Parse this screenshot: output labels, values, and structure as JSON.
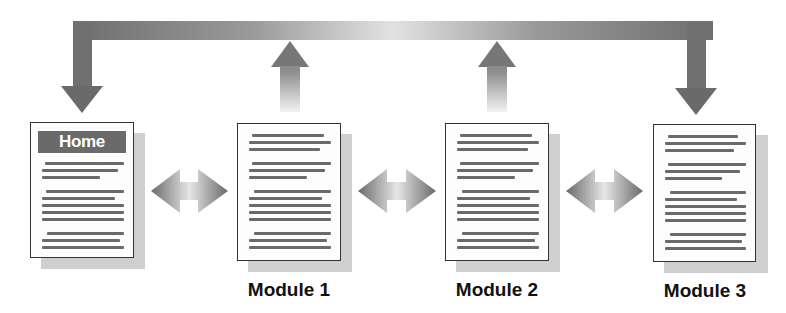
{
  "diagram": {
    "type": "module-navigation-flow",
    "home": {
      "banner": "Home Page"
    },
    "modules": [
      {
        "label": "Module 1"
      },
      {
        "label": "Module 2"
      },
      {
        "label": "Module 3"
      }
    ],
    "arrows": {
      "top_loop": "feedback bar from modules back to Home Page and Module 3",
      "up_arrows": [
        "Module 1 up",
        "Module 2 up"
      ],
      "bidirectional": [
        "Home Page <-> Module 1",
        "Module 1 <-> Module 2",
        "Module 2 <-> Module 3"
      ]
    },
    "colors": {
      "arrow_dark": "#6e6e6e",
      "arrow_light": "#e6e6e6",
      "doc_border": "#333333",
      "text_line": "#6a6a6a",
      "shadow": "#cfcfcf",
      "banner_bg": "#6a6a6a"
    }
  }
}
